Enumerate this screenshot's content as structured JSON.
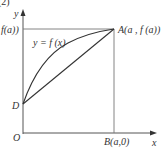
{
  "figure": {
    "caption_partial": "(2)",
    "y_axis_label": "y",
    "x_axis_label": "x",
    "origin_label": "O",
    "y_tick_label": "f(a))",
    "point_D_label": "D",
    "point_A_label": "A(a , f (a))",
    "point_B_label": "B(a,0)",
    "curve_label": "y = f (x)",
    "colors": {
      "stroke": "#333333",
      "frame": "#888888",
      "background": "#ffffff"
    }
  }
}
